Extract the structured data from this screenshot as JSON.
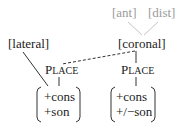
{
  "diagram": {
    "nodes": {
      "ant": "[ant]",
      "dist": "[dist]",
      "coronal": "[coronal]",
      "lateral": "[lateral]",
      "place_left": {
        "cap": "P",
        "rest": "LACE"
      },
      "place_right": {
        "cap": "P",
        "rest": "LACE"
      }
    },
    "matrices": {
      "left": [
        "+cons",
        "+son"
      ],
      "right": [
        "+cons",
        "+/−son"
      ]
    },
    "edges": [
      {
        "from": "ant",
        "to": "coronal",
        "style": "solid",
        "color": "#bdbdbd"
      },
      {
        "from": "dist",
        "to": "coronal",
        "style": "solid",
        "color": "#bdbdbd"
      },
      {
        "from": "coronal",
        "to": "place_right",
        "style": "solid"
      },
      {
        "from": "coronal",
        "to": "place_left",
        "style": "dashed"
      },
      {
        "from": "lateral",
        "to": "matrix_left",
        "style": "solid"
      },
      {
        "from": "place_left",
        "to": "matrix_left",
        "style": "solid"
      },
      {
        "from": "place_right",
        "to": "matrix_right",
        "style": "solid"
      }
    ],
    "colors": {
      "dependent_features": "#9a9a9a",
      "text": "#222222"
    }
  }
}
